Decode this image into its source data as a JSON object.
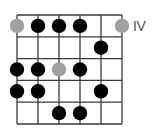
{
  "diagram": {
    "type": "guitar-scale-fretboard",
    "strings": 6,
    "frets": 5,
    "position_label": "IV",
    "colors": {
      "line": "#3a3a3a",
      "note": "#000000",
      "root": "#a0a0a0",
      "label": "#555555"
    },
    "notes": [
      {
        "fret": 1,
        "string": 1,
        "root": true
      },
      {
        "fret": 1,
        "string": 2,
        "root": false
      },
      {
        "fret": 1,
        "string": 3,
        "root": false
      },
      {
        "fret": 1,
        "string": 4,
        "root": false
      },
      {
        "fret": 1,
        "string": 6,
        "root": true
      },
      {
        "fret": 2,
        "string": 5,
        "root": false
      },
      {
        "fret": 3,
        "string": 1,
        "root": false
      },
      {
        "fret": 3,
        "string": 2,
        "root": false
      },
      {
        "fret": 3,
        "string": 3,
        "root": true
      },
      {
        "fret": 3,
        "string": 4,
        "root": false
      },
      {
        "fret": 4,
        "string": 1,
        "root": false
      },
      {
        "fret": 4,
        "string": 2,
        "root": false
      },
      {
        "fret": 4,
        "string": 5,
        "root": false
      },
      {
        "fret": 5,
        "string": 3,
        "root": false
      },
      {
        "fret": 5,
        "string": 4,
        "root": false
      }
    ]
  }
}
